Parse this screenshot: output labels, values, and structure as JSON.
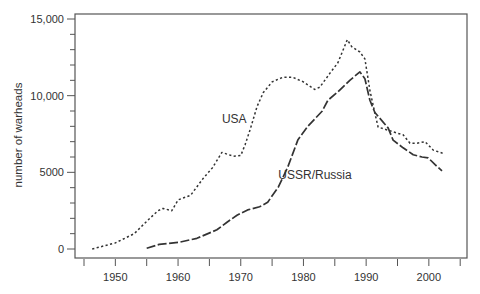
{
  "chart_data": {
    "type": "line",
    "title": "",
    "xlabel": "",
    "ylabel": "number of warheads",
    "xlim": [
      1943.7,
      2006
    ],
    "ylim": [
      -600,
      15000
    ],
    "x_ticks": [
      1945,
      1950,
      1955,
      1960,
      1965,
      1970,
      1975,
      1980,
      1985,
      1990,
      1995,
      2000,
      2005
    ],
    "x_tick_labels": [
      "",
      "1950",
      "",
      "1960",
      "",
      "1970",
      "",
      "1980",
      "",
      "1990",
      "",
      "2000",
      ""
    ],
    "y_ticks": [
      0,
      1000,
      2000,
      3000,
      4000,
      5000,
      6000,
      7000,
      8000,
      9000,
      10000,
      11000,
      12000,
      13000,
      14000,
      15000
    ],
    "y_tick_labels": [
      "0",
      "",
      "",
      "",
      "",
      "5000",
      "",
      "",
      "",
      "",
      "10,000",
      "",
      "",
      "",
      "",
      "15,000"
    ],
    "grid": false,
    "legend": "inline labels",
    "series": [
      {
        "name": "USA",
        "style": "dotted",
        "label_pos": [
          1967.0,
          8500
        ],
        "points": [
          [
            1946.3,
            0
          ],
          [
            1950,
            400
          ],
          [
            1953,
            1000
          ],
          [
            1954,
            1400
          ],
          [
            1955.5,
            2000
          ],
          [
            1956.8,
            2500
          ],
          [
            1957.6,
            2650
          ],
          [
            1959,
            2500
          ],
          [
            1960,
            3200
          ],
          [
            1962,
            3500
          ],
          [
            1964,
            4600
          ],
          [
            1965.5,
            5300
          ],
          [
            1967,
            6300
          ],
          [
            1968.8,
            6050
          ],
          [
            1970,
            6100
          ],
          [
            1970.7,
            6800
          ],
          [
            1971.5,
            7800
          ],
          [
            1972.6,
            9300
          ],
          [
            1973.6,
            10200
          ],
          [
            1975,
            10900
          ],
          [
            1976.7,
            11200
          ],
          [
            1978.3,
            11200
          ],
          [
            1980,
            10900
          ],
          [
            1981.8,
            10400
          ],
          [
            1982.6,
            10550
          ],
          [
            1984.2,
            11450
          ],
          [
            1985.5,
            12150
          ],
          [
            1987,
            13650
          ],
          [
            1987.7,
            13200
          ],
          [
            1989,
            12850
          ],
          [
            1989.8,
            12400
          ],
          [
            1990.6,
            10350
          ],
          [
            1991.4,
            8850
          ],
          [
            1991.9,
            7950
          ],
          [
            1993.5,
            7750
          ],
          [
            1995,
            7550
          ],
          [
            1995.9,
            7450
          ],
          [
            1997,
            6900
          ],
          [
            1998.1,
            6900
          ],
          [
            1999.4,
            7000
          ],
          [
            2000.7,
            6450
          ],
          [
            2002.2,
            6250
          ]
        ]
      },
      {
        "name": "USSR/Russia",
        "style": "dashed",
        "label_pos": [
          1976.0,
          4800
        ],
        "points": [
          [
            1955,
            50
          ],
          [
            1957,
            300
          ],
          [
            1960.3,
            450
          ],
          [
            1963,
            700
          ],
          [
            1966.2,
            1250
          ],
          [
            1967.8,
            1750
          ],
          [
            1969.4,
            2200
          ],
          [
            1971.1,
            2550
          ],
          [
            1973,
            2750
          ],
          [
            1974.3,
            3050
          ],
          [
            1976,
            4050
          ],
          [
            1977.5,
            5350
          ],
          [
            1979.1,
            7100
          ],
          [
            1980.7,
            8000
          ],
          [
            1983,
            9000
          ],
          [
            1983.9,
            9700
          ],
          [
            1985.5,
            10250
          ],
          [
            1987.4,
            11000
          ],
          [
            1989,
            11550
          ],
          [
            1989.8,
            11100
          ],
          [
            1990.6,
            9700
          ],
          [
            1991.4,
            8900
          ],
          [
            1993.5,
            7900
          ],
          [
            1994.3,
            7100
          ],
          [
            1995.9,
            6600
          ],
          [
            1997.5,
            6150
          ],
          [
            1998.9,
            6000
          ],
          [
            1999.9,
            5950
          ],
          [
            2001,
            5500
          ],
          [
            2002.1,
            5100
          ]
        ]
      }
    ]
  }
}
